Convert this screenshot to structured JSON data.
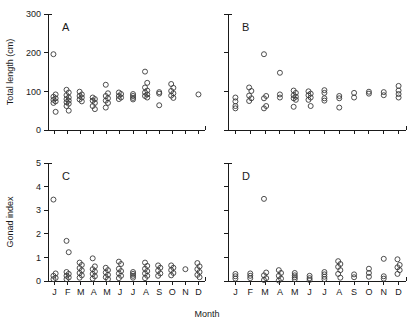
{
  "figure": {
    "xlabel": "Month",
    "panels": [
      "A",
      "B",
      "C",
      "D"
    ]
  },
  "chart_data": {
    "type": "scatter",
    "title": "",
    "xlabel": "Month",
    "grid": false,
    "legend": "none",
    "categories": [
      "J",
      "F",
      "M",
      "A",
      "M",
      "J",
      "J",
      "A",
      "S",
      "O",
      "N",
      "D"
    ],
    "panels": [
      {
        "label": "A",
        "ylabel": "Total length (cm)",
        "ylim": [
          0,
          300
        ],
        "yticks": [
          0,
          100,
          200,
          300
        ],
        "ytick_labels": [
          "0",
          "100",
          "200",
          "300"
        ],
        "xlim_categories": [
          "J",
          "F",
          "M",
          "A",
          "M",
          "J",
          "J",
          "A",
          "S",
          "O",
          "N",
          "D"
        ],
        "series": [
          {
            "name": "J",
            "values": [
              196,
              92,
              86,
              82,
              78,
              74,
              70,
              47
            ]
          },
          {
            "name": "F",
            "values": [
              104,
              97,
              90,
              84,
              80,
              76,
              72,
              68,
              62,
              50
            ]
          },
          {
            "name": "M",
            "values": [
              99,
              92,
              88,
              84,
              79,
              74
            ]
          },
          {
            "name": "A",
            "values": [
              84,
              80,
              76,
              70,
              62,
              54
            ]
          },
          {
            "name": "M",
            "values": [
              117,
              95,
              88,
              82,
              76,
              70,
              58
            ]
          },
          {
            "name": "J",
            "values": [
              97,
              93,
              88,
              84,
              80
            ]
          },
          {
            "name": "J",
            "values": [
              93,
              88,
              83,
              79
            ]
          },
          {
            "name": "A",
            "values": [
              151,
              122,
              110,
              102,
              97,
              92,
              88,
              84
            ]
          },
          {
            "name": "S",
            "values": [
              98,
              94,
              64
            ]
          },
          {
            "name": "O",
            "values": [
              119,
              109,
              101,
              95,
              89,
              83
            ]
          },
          {
            "name": "N",
            "values": []
          },
          {
            "name": "D",
            "values": [
              92
            ]
          }
        ]
      },
      {
        "label": "B",
        "ylabel": "Total length (cm)",
        "ylim": [
          0,
          300
        ],
        "yticks": [
          0,
          100,
          200,
          300
        ],
        "ytick_labels": [
          "0",
          "100",
          "200",
          "300"
        ],
        "series": [
          {
            "name": "J",
            "values": [
              84,
              74,
              62,
              56
            ]
          },
          {
            "name": "F",
            "values": [
              110,
              101,
              89,
              82,
              75
            ]
          },
          {
            "name": "M",
            "values": [
              196,
              88,
              82,
              62,
              56
            ]
          },
          {
            "name": "A",
            "values": [
              148,
              92,
              84
            ]
          },
          {
            "name": "M",
            "values": [
              102,
              96,
              90,
              86,
              82,
              78,
              60
            ]
          },
          {
            "name": "J",
            "values": [
              100,
              94,
              90,
              84,
              78,
              62
            ]
          },
          {
            "name": "J",
            "values": [
              103,
              96,
              82,
              76
            ]
          },
          {
            "name": "A",
            "values": [
              88,
              82,
              58
            ]
          },
          {
            "name": "S",
            "values": [
              96,
              84
            ]
          },
          {
            "name": "O",
            "values": [
              99,
              94
            ]
          },
          {
            "name": "N",
            "values": [
              98,
              90
            ]
          },
          {
            "name": "D",
            "values": [
              114,
              102,
              93,
              84
            ]
          }
        ]
      },
      {
        "label": "C",
        "ylabel": "Gonad index",
        "ylim": [
          0,
          5
        ],
        "yticks": [
          0,
          1,
          2,
          3,
          4,
          5
        ],
        "ytick_labels": [
          "0",
          "1",
          "2",
          "3",
          "4",
          "5"
        ],
        "series": [
          {
            "name": "J",
            "values": [
              3.45,
              0.32,
              0.22,
              0.13,
              0.08
            ]
          },
          {
            "name": "F",
            "values": [
              1.7,
              1.22,
              0.38,
              0.3,
              0.22,
              0.15,
              0.08
            ]
          },
          {
            "name": "M",
            "values": [
              0.78,
              0.68,
              0.55,
              0.45,
              0.34,
              0.24,
              0.14
            ]
          },
          {
            "name": "A",
            "values": [
              0.96,
              0.62,
              0.5,
              0.4,
              0.3,
              0.2,
              0.1
            ]
          },
          {
            "name": "M",
            "values": [
              0.56,
              0.46,
              0.36,
              0.26,
              0.16,
              0.08
            ]
          },
          {
            "name": "J",
            "values": [
              0.82,
              0.72,
              0.52,
              0.42,
              0.32,
              0.22,
              0.12
            ]
          },
          {
            "name": "J",
            "values": [
              0.38,
              0.3,
              0.22,
              0.14
            ]
          },
          {
            "name": "A",
            "values": [
              0.78,
              0.64,
              0.52,
              0.42,
              0.32,
              0.22,
              0.12
            ]
          },
          {
            "name": "S",
            "values": [
              0.66,
              0.56,
              0.44,
              0.32,
              0.22
            ]
          },
          {
            "name": "O",
            "values": [
              0.66,
              0.56,
              0.46,
              0.34,
              0.24
            ]
          },
          {
            "name": "N",
            "values": [
              0.5
            ]
          },
          {
            "name": "D",
            "values": [
              0.76,
              0.62,
              0.5,
              0.38,
              0.26,
              0.16
            ]
          }
        ]
      },
      {
        "label": "D",
        "ylabel": "Gonad index",
        "ylim": [
          0,
          5
        ],
        "yticks": [
          0,
          1,
          2,
          3,
          4,
          5
        ],
        "ytick_labels": [
          "0",
          "1",
          "2",
          "3",
          "4",
          "5"
        ],
        "series": [
          {
            "name": "J",
            "values": [
              0.3,
              0.2,
              0.1
            ]
          },
          {
            "name": "F",
            "values": [
              0.32,
              0.22,
              0.12
            ]
          },
          {
            "name": "M",
            "values": [
              3.48,
              0.36,
              0.24,
              0.12,
              0.04
            ]
          },
          {
            "name": "A",
            "values": [
              0.46,
              0.34,
              0.22,
              0.1,
              0.02
            ]
          },
          {
            "name": "M",
            "values": [
              0.34,
              0.24,
              0.16,
              0.08
            ]
          },
          {
            "name": "J",
            "values": [
              0.22,
              0.12,
              0.04
            ]
          },
          {
            "name": "J",
            "values": [
              0.38,
              0.28,
              0.18,
              0.08
            ]
          },
          {
            "name": "A",
            "values": [
              0.84,
              0.72,
              0.6,
              0.46,
              0.3,
              0.14
            ]
          },
          {
            "name": "S",
            "values": [
              0.28,
              0.16
            ]
          },
          {
            "name": "O",
            "values": [
              0.52,
              0.34,
              0.18
            ]
          },
          {
            "name": "N",
            "values": [
              0.94,
              0.2,
              0.1
            ]
          },
          {
            "name": "D",
            "values": [
              0.92,
              0.68,
              0.58,
              0.46,
              0.3
            ]
          }
        ]
      }
    ]
  }
}
